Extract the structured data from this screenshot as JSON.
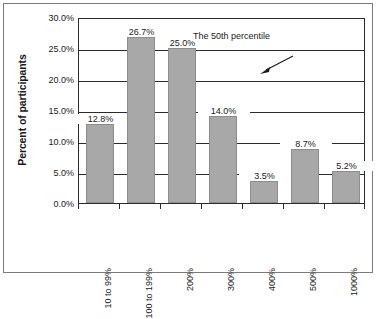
{
  "chart_data": {
    "type": "bar",
    "title": "",
    "subtitle": "",
    "xlabel": "",
    "ylabel": "Percent of participants",
    "categories": [
      "10 to 99%",
      "100 to 199%",
      "200%",
      "300%",
      "400%",
      "500%",
      "1000%"
    ],
    "values": [
      12.8,
      26.7,
      25.0,
      14.0,
      3.5,
      8.7,
      5.2
    ],
    "value_labels": [
      "12.8%",
      "26.7%",
      "25.0%",
      "14.0%",
      "3.5%",
      "8.7%",
      "5.2%"
    ],
    "ylim": [
      0,
      30
    ],
    "ytick_values": [
      0,
      5,
      10,
      15,
      20,
      25,
      30
    ],
    "ytick_labels": [
      "0.0%",
      "5.0%",
      "10.0%",
      "15.0%",
      "20.0%",
      "25.0%",
      "30.0%"
    ],
    "grid": true,
    "grid_axis": "y",
    "legend": false,
    "legend_position": "none",
    "bar_color": "#a8a8a8",
    "bar_edge_color": "#8d8d8d",
    "axis_color": "#2b2b2b",
    "text_color": "#1a1a1a",
    "background_color": "#ffffff",
    "annotations": [
      {
        "text": "The 50th percentile",
        "points_to_category": "200%",
        "points_to_value": 25.0
      }
    ]
  },
  "axis": {
    "y_title": "Percent of participants"
  },
  "annotation": {
    "label": "The 50th percentile"
  }
}
